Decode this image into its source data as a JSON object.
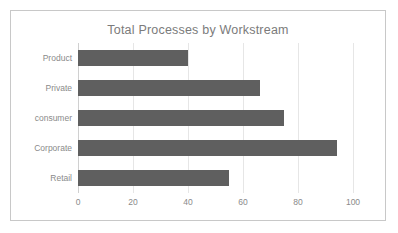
{
  "chart_data": {
    "type": "bar",
    "orientation": "horizontal",
    "title": "Total Processes by Workstream",
    "xlabel": "",
    "ylabel": "",
    "categories": [
      "Product",
      "Private",
      "consumer",
      "Corporate",
      "Retail"
    ],
    "values": [
      40,
      66,
      75,
      94,
      55
    ],
    "series": [
      {
        "name": "Total Processes",
        "values": [
          40,
          66,
          75,
          94,
          55
        ]
      }
    ],
    "xlim": [
      0,
      100
    ],
    "x_ticks": [
      0,
      20,
      40,
      60,
      80,
      100
    ],
    "x_tick_labels": [
      "0",
      "20",
      "40",
      "60",
      "80",
      "100"
    ],
    "grid": "vertical",
    "legend": "none",
    "colors": {
      "bar": "#5f5f5f",
      "gridline": "#e6e6e6",
      "axis": "#d0d0d0",
      "title_text": "#7b7b7b",
      "tick_text": "#8a8a8a",
      "frame_border": "#c8c8c8",
      "background": "#ffffff"
    }
  }
}
